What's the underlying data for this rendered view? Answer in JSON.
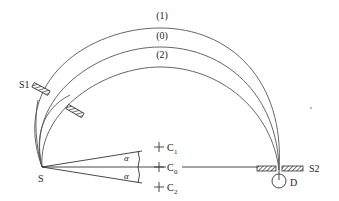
{
  "diagram": {
    "title": "",
    "paths": [
      {
        "id": "1",
        "label": "(1)"
      },
      {
        "id": "0",
        "label": "(0)"
      },
      {
        "id": "2",
        "label": "(2)"
      }
    ],
    "source": {
      "label": "S"
    },
    "slit1": {
      "label": "S1"
    },
    "slit2": {
      "label": "S2"
    },
    "detector": {
      "label": "D"
    },
    "centers": [
      {
        "label": "C",
        "subscript": "1"
      },
      {
        "label": "C",
        "subscript": "0"
      },
      {
        "label": "C",
        "subscript": "2"
      }
    ],
    "angle_label": "α",
    "colors": {
      "line": "#333333",
      "arc": "#555555",
      "hatch": "#444444"
    }
  }
}
